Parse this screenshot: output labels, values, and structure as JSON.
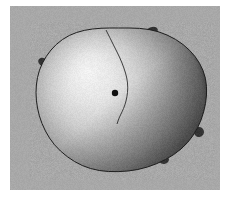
{
  "figure": {
    "title": "",
    "canvas": {
      "width": 231,
      "height": 199
    },
    "page_background": "#ffffff",
    "plot_background": "#a8a8a8",
    "plot_rect": {
      "x": 10,
      "y": 6,
      "width": 210,
      "height": 184
    }
  },
  "chart_data": {
    "type": "scatter",
    "title": "",
    "subtitle": "",
    "xlabel": "",
    "ylabel": "",
    "grid": false,
    "legend": null,
    "background_color": "#a8a8a8",
    "surface": {
      "name": "blob-surface",
      "silhouette_points": [
        [
          118,
          28
        ],
        [
          140,
          28
        ],
        [
          158,
          31
        ],
        [
          176,
          39
        ],
        [
          190,
          50
        ],
        [
          200,
          63
        ],
        [
          206,
          78
        ],
        [
          207,
          95
        ],
        [
          204,
          112
        ],
        [
          198,
          128
        ],
        [
          188,
          143
        ],
        [
          174,
          155
        ],
        [
          157,
          164
        ],
        [
          138,
          170
        ],
        [
          118,
          172
        ],
        [
          99,
          171
        ],
        [
          82,
          166
        ],
        [
          67,
          157
        ],
        [
          54,
          145
        ],
        [
          45,
          131
        ],
        [
          39,
          116
        ],
        [
          36,
          100
        ],
        [
          36,
          85
        ],
        [
          39,
          70
        ],
        [
          46,
          56
        ],
        [
          56,
          44
        ],
        [
          69,
          35
        ],
        [
          84,
          30
        ],
        [
          101,
          28
        ]
      ],
      "highlight_center": [
        88,
        72
      ],
      "highlight_color": "#f2f2f2",
      "shadow_color": "#262626",
      "midtone_color": "#8a8a8a",
      "edge_color": "#1e1e1e"
    },
    "marker": {
      "name": "surface-point",
      "x": 115,
      "y": 93,
      "radius": 3.2,
      "color": "#111111"
    },
    "curve": {
      "name": "geodesic-curve",
      "color": "#2b2b2b",
      "width": 0.9,
      "points": [
        [
          106,
          30
        ],
        [
          110,
          38
        ],
        [
          115,
          48
        ],
        [
          120,
          58
        ],
        [
          124,
          68
        ],
        [
          127,
          78
        ],
        [
          128,
          88
        ],
        [
          127,
          97
        ],
        [
          125,
          105
        ],
        [
          122,
          112
        ],
        [
          119,
          118
        ],
        [
          117,
          124
        ]
      ]
    },
    "nubs": [
      {
        "name": "nub-top-right",
        "x": 152,
        "y": 31,
        "w": 6,
        "h": 4,
        "angle": -18
      },
      {
        "name": "nub-left-upper",
        "x": 43,
        "y": 62,
        "w": 5,
        "h": 4,
        "angle": 28
      },
      {
        "name": "nub-right-lower",
        "x": 199,
        "y": 132,
        "w": 5,
        "h": 5,
        "angle": 12
      },
      {
        "name": "nub-bottom-left",
        "x": 92,
        "y": 164,
        "w": 6,
        "h": 4,
        "angle": 6
      },
      {
        "name": "nub-bottom-right",
        "x": 164,
        "y": 160,
        "w": 5,
        "h": 4,
        "angle": -8
      }
    ]
  }
}
